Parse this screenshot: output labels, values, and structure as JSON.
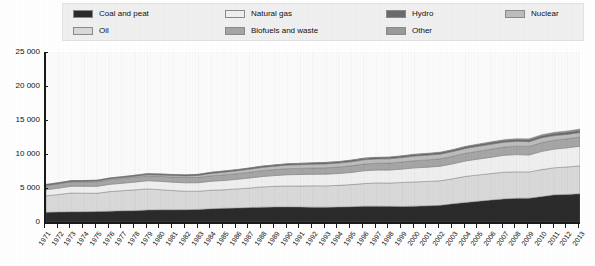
{
  "legend": {
    "columns": [
      [
        {
          "label": "Coal and peat",
          "color": "#2b2b2b",
          "key": "coal"
        },
        {
          "label": "Oil",
          "color": "#d9d9d9",
          "key": "oil"
        }
      ],
      [
        {
          "label": "Natural gas",
          "color": "#efefef",
          "key": "gas"
        },
        {
          "label": "Biofuels and waste",
          "color": "#a6a6a6",
          "key": "biofuels"
        }
      ],
      [
        {
          "label": "Hydro",
          "color": "#6b6b6b",
          "key": "hydro"
        },
        {
          "label": "Other",
          "color": "#9a9a9a",
          "key": "other"
        }
      ],
      [
        {
          "label": "Nuclear",
          "color": "#bdbdbd",
          "key": "nuclear"
        }
      ]
    ]
  },
  "chart_data": {
    "type": "area",
    "title": "",
    "subtitle": "",
    "xlabel": "",
    "ylabel": "",
    "stacked": true,
    "grid": false,
    "legend_position": "top",
    "xlim": [
      1971,
      2013
    ],
    "ylim": [
      0,
      25000
    ],
    "ytick_labels": [
      "0",
      "5 000",
      "10 000",
      "15 000",
      "20 000",
      "25 000"
    ],
    "ytick_values": [
      0,
      5000,
      10000,
      15000,
      20000,
      25000
    ],
    "x": [
      1971,
      1972,
      1973,
      1974,
      1975,
      1976,
      1977,
      1978,
      1979,
      1980,
      1981,
      1982,
      1983,
      1984,
      1985,
      1986,
      1987,
      1988,
      1989,
      1990,
      1991,
      1992,
      1993,
      1994,
      1995,
      1996,
      1997,
      1998,
      1999,
      2000,
      2001,
      2002,
      2003,
      2004,
      2005,
      2006,
      2007,
      2008,
      2009,
      2010,
      2011,
      2012,
      2013
    ],
    "xtick_labels": [
      "1971",
      "1972",
      "1973",
      "1974",
      "1975",
      "1976",
      "1977",
      "1978",
      "1979",
      "1980",
      "1981",
      "1982",
      "1983",
      "1984",
      "1985",
      "1986",
      "1987",
      "1988",
      "1989",
      "1990",
      "1991",
      "1992",
      "1993",
      "1994",
      "1995",
      "1996",
      "1997",
      "1998",
      "1999",
      "2000",
      "2001",
      "2002",
      "2003",
      "2004",
      "2005",
      "2006",
      "2007",
      "2008",
      "2009",
      "2010",
      "2011",
      "2012",
      "2013"
    ],
    "series": [
      {
        "name": "Coal and peat",
        "color": "#2b2b2b",
        "values": [
          1440,
          1460,
          1500,
          1510,
          1530,
          1590,
          1640,
          1670,
          1760,
          1790,
          1790,
          1810,
          1850,
          1950,
          2020,
          2050,
          2120,
          2180,
          2210,
          2220,
          2200,
          2180,
          2180,
          2200,
          2250,
          2320,
          2330,
          2300,
          2290,
          2320,
          2380,
          2450,
          2680,
          2880,
          3050,
          3220,
          3400,
          3480,
          3510,
          3750,
          3990,
          4060,
          4150
        ]
      },
      {
        "name": "Oil",
        "color": "#d9d9d9",
        "values": [
          2410,
          2580,
          2770,
          2730,
          2700,
          2880,
          2960,
          3060,
          3110,
          2960,
          2830,
          2720,
          2680,
          2720,
          2720,
          2820,
          2880,
          2980,
          3030,
          3080,
          3090,
          3140,
          3130,
          3190,
          3250,
          3330,
          3420,
          3430,
          3520,
          3570,
          3590,
          3610,
          3680,
          3830,
          3870,
          3900,
          3930,
          3900,
          3850,
          3960,
          3990,
          4030,
          4110
        ]
      },
      {
        "name": "Natural gas",
        "color": "#efefef",
        "values": [
          895,
          945,
          995,
          1010,
          1010,
          1070,
          1100,
          1140,
          1210,
          1230,
          1230,
          1230,
          1250,
          1330,
          1370,
          1400,
          1470,
          1530,
          1590,
          1650,
          1690,
          1700,
          1730,
          1740,
          1790,
          1880,
          1890,
          1910,
          1970,
          2070,
          2090,
          2140,
          2200,
          2270,
          2330,
          2400,
          2480,
          2530,
          2490,
          2680,
          2750,
          2820,
          2890
        ]
      },
      {
        "name": "Biofuels and waste",
        "color": "#a6a6a6",
        "values": [
          635,
          645,
          655,
          665,
          680,
          690,
          700,
          715,
          725,
          740,
          755,
          770,
          785,
          800,
          815,
          830,
          845,
          860,
          875,
          895,
          905,
          920,
          935,
          950,
          975,
          995,
          1010,
          1025,
          1040,
          1060,
          1075,
          1090,
          1110,
          1130,
          1160,
          1185,
          1210,
          1240,
          1260,
          1290,
          1310,
          1330,
          1350
        ]
      },
      {
        "name": "Nuclear",
        "color": "#bdbdbd",
        "values": [
          29,
          42,
          53,
          69,
          98,
          115,
          140,
          160,
          165,
          186,
          225,
          245,
          285,
          345,
          400,
          420,
          450,
          480,
          500,
          525,
          545,
          555,
          570,
          580,
          600,
          620,
          620,
          630,
          655,
          675,
          690,
          690,
          690,
          710,
          720,
          720,
          710,
          710,
          700,
          720,
          670,
          640,
          645
        ]
      },
      {
        "name": "Hydro",
        "color": "#6b6b6b",
        "values": [
          104,
          108,
          110,
          116,
          119,
          118,
          122,
          129,
          133,
          139,
          143,
          148,
          154,
          158,
          161,
          165,
          167,
          171,
          171,
          184,
          186,
          188,
          194,
          197,
          205,
          210,
          212,
          217,
          222,
          226,
          224,
          225,
          232,
          240,
          250,
          261,
          265,
          277,
          284,
          297,
          308,
          317,
          327
        ]
      },
      {
        "name": "Other",
        "color": "#9a9a9a",
        "values": [
          6,
          7,
          7,
          8,
          8,
          9,
          9,
          10,
          11,
          12,
          13,
          14,
          15,
          17,
          19,
          21,
          22,
          24,
          26,
          28,
          30,
          32,
          34,
          37,
          40,
          43,
          46,
          50,
          54,
          59,
          63,
          68,
          74,
          81,
          89,
          99,
          110,
          123,
          136,
          152,
          169,
          186,
          205
        ]
      }
    ]
  }
}
